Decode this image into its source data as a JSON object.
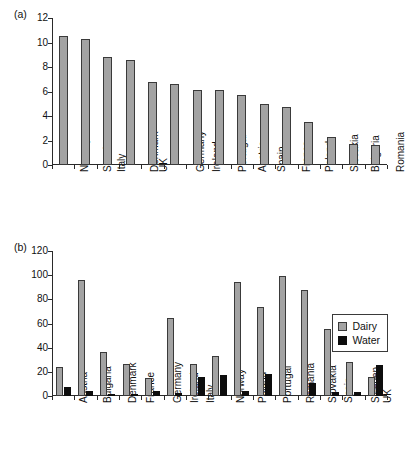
{
  "panels": [
    {
      "tag": "(a)",
      "chart_index": 0
    },
    {
      "tag": "(b)",
      "chart_index": 1
    }
  ],
  "legend": {
    "dairy_label": "Dairy",
    "water_label": "Water"
  },
  "colors": {
    "dairy": "#a3a3a3",
    "water": "#0d0d0d",
    "axis": "#2a2a2a",
    "background": "#ffffff"
  },
  "chart_data": [
    {
      "type": "bar",
      "panel": "(a)",
      "title": "",
      "xlabel": "",
      "ylabel": "",
      "ylim": [
        0,
        12
      ],
      "yticks": [
        0,
        2,
        4,
        6,
        8,
        10,
        12
      ],
      "grid": false,
      "legend": "none",
      "categories": [
        "Norway",
        "Sweden",
        "Italy",
        "Denmark",
        "UK",
        "Germany",
        "Ireland",
        "Portugal",
        "Austria",
        "Spain",
        "France",
        "Poland",
        "Slovakia",
        "Bulgaria",
        "Romania"
      ],
      "values": [
        10.5,
        10.3,
        8.8,
        8.6,
        6.75,
        6.6,
        6.1,
        6.1,
        5.75,
        5.0,
        4.75,
        3.55,
        2.25,
        1.7,
        1.65
      ]
    },
    {
      "type": "bar",
      "panel": "(b)",
      "title": "",
      "xlabel": "",
      "ylabel": "",
      "ylim": [
        0,
        120
      ],
      "yticks": [
        0,
        20,
        40,
        60,
        80,
        100,
        120
      ],
      "grid": false,
      "legend": "upper right",
      "categories": [
        "Austria",
        "Bulgaria",
        "Denmark",
        "France",
        "Germany",
        "Ireland",
        "Italy",
        "Norway",
        "Poland",
        "Portugal",
        "Romania",
        "Slovakia",
        "Spain",
        "Sweden",
        "UK"
      ],
      "series": [
        {
          "name": "Dairy",
          "values": [
            24,
            96,
            36.5,
            26.5,
            14.5,
            64.5,
            26.5,
            33.5,
            94.5,
            73.5,
            99,
            87.5,
            55.5,
            28.5,
            15.5
          ]
        },
        {
          "name": "Water",
          "values": [
            7.5,
            4,
            2,
            2,
            4.5,
            2.5,
            16,
            17,
            4,
            18,
            0,
            10.5,
            3,
            3.5,
            25.5
          ]
        }
      ]
    }
  ]
}
